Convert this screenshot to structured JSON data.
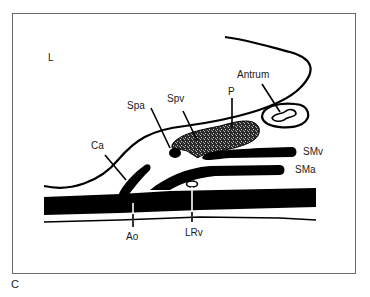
{
  "figure": {
    "panel_label": "C",
    "orientation_label": "L",
    "labels": {
      "antrum": "Antrum",
      "spa": "Spa",
      "spv": "Spv",
      "p": "P",
      "ca": "Ca",
      "smv": "SMv",
      "sma": "SMa",
      "ao": "Ao",
      "lrv": "LRv"
    },
    "colors": {
      "ink": "#000000",
      "frame": "#6a6a6a",
      "background": "#ffffff",
      "stipple": "#3a3a3a"
    }
  }
}
